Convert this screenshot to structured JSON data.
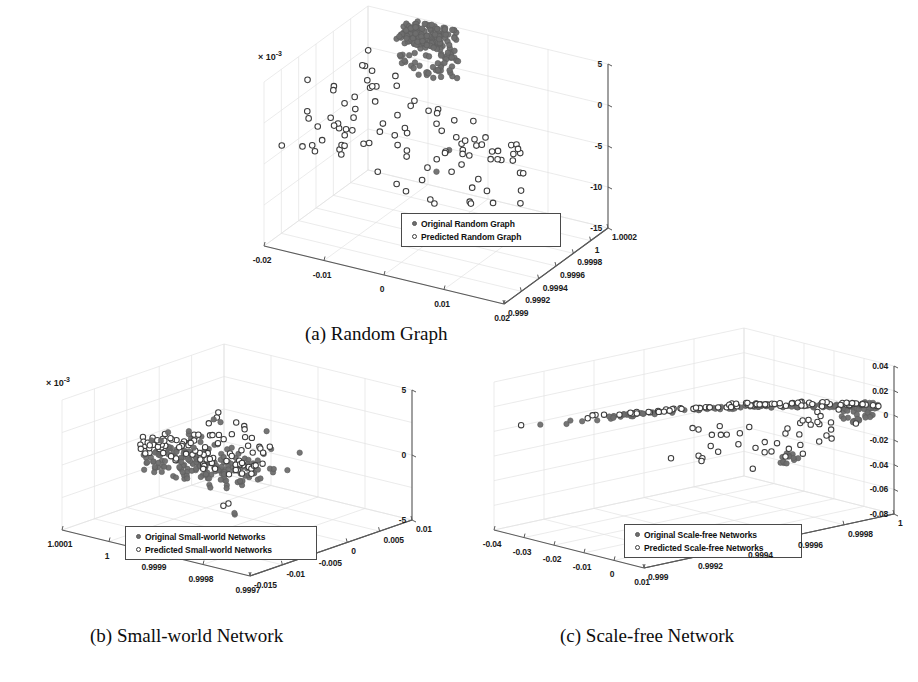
{
  "figure": {
    "background": "#ffffff",
    "marker_filled_color": "#6e6e6e",
    "marker_hollow_color": "#3c3c3c",
    "axis_color": "#5a5a5a",
    "grid_color": "#e2e2e2"
  },
  "panels": [
    {
      "id": "a",
      "caption": "(a) Random Graph",
      "exponent_label": "× 10",
      "exponent_sup": "-3",
      "z_ticks": [
        "5",
        "0",
        "-5",
        "-10",
        "-15"
      ],
      "x_ticks": [
        "-0.02",
        "-0.01",
        "0",
        "0.01",
        "0.02"
      ],
      "y_ticks": [
        "0.999",
        "0.9992",
        "0.9994",
        "0.9996",
        "0.9998",
        "1",
        "1.0002"
      ],
      "legend": {
        "original": "Original Random Graph",
        "predicted": "Predicted Random Graph"
      }
    },
    {
      "id": "b",
      "caption": "(b) Small-world Network",
      "exponent_label": "× 10",
      "exponent_sup": "-3",
      "z_ticks": [
        "5",
        "0",
        "-5"
      ],
      "x_ticks": [
        "1.0001",
        "1",
        "0.9999",
        "0.9998",
        "0.9997"
      ],
      "y_ticks": [
        "-0.015",
        "-0.01",
        "-0.005",
        "0",
        "0.005",
        "0.01"
      ],
      "legend": {
        "original": "Original Small-world Networks",
        "predicted": "Predicted Small-world Networks"
      }
    },
    {
      "id": "c",
      "caption": "(c) Scale-free Network",
      "exponent_label": "",
      "exponent_sup": "",
      "z_ticks": [
        "0.04",
        "0.02",
        "0",
        "-0.02",
        "-0.04",
        "-0.06",
        "-0.08"
      ],
      "x_ticks": [
        "-0.04",
        "-0.03",
        "-0.02",
        "-0.01",
        "0",
        "0.01"
      ],
      "y_ticks": [
        "0.999",
        "0.9992",
        "0.9994",
        "0.9996",
        "0.9998",
        "1"
      ],
      "legend": {
        "original": "Original Scale-free Networks",
        "predicted": "Predicted Scale-free Networks"
      }
    }
  ],
  "chart_data": {
    "type": "scatter",
    "title": "",
    "projection": "3d",
    "panels": [
      {
        "id": "a",
        "title": "(a) Random Graph",
        "xlabel": "",
        "ylabel": "",
        "zlabel": "",
        "xlim": [
          -0.02,
          0.02
        ],
        "ylim": [
          0.999,
          1.0002
        ],
        "zlim": [
          -0.015,
          0.005
        ],
        "z_scale": "x 10^-3",
        "grid": true,
        "legend_position": "lower-center",
        "series": [
          {
            "name": "Original Random Graph",
            "marker": "filled-circle",
            "color": "#6e6e6e",
            "n_points": 190,
            "description": "Dense crescent-shaped cluster concentrated at high y (near 1.0000-1.0002) arcing from z=+0.005 down to z=-0.005"
          },
          {
            "name": "Predicted Random Graph",
            "marker": "open-circle",
            "color": "#3c3c3c",
            "n_points": 95,
            "description": "Sparse scatter spread across full x range with z mostly between -0.010 and +0.005"
          }
        ]
      },
      {
        "id": "b",
        "title": "(b) Small-world Network",
        "xlabel": "",
        "ylabel": "",
        "zlabel": "",
        "xlim": [
          0.9997,
          1.0001
        ],
        "ylim": [
          -0.015,
          0.01
        ],
        "zlim": [
          -0.005,
          0.005
        ],
        "z_scale": "x 10^-3",
        "grid": true,
        "legend_position": "lower-center",
        "series": [
          {
            "name": "Original Small-world Networks",
            "marker": "filled-circle",
            "color": "#6e6e6e",
            "n_points": 160,
            "description": "Dense horizontal band clustered near z=0, spread in left-center of the box"
          },
          {
            "name": "Predicted Small-world Networks",
            "marker": "open-circle",
            "color": "#3c3c3c",
            "n_points": 110,
            "description": "Overlapping band slightly above the filled band, with several outliers extending right and two low outliers near z=-0.0035"
          }
        ]
      },
      {
        "id": "c",
        "title": "(c) Scale-free Network",
        "xlabel": "",
        "ylabel": "",
        "zlabel": "",
        "xlim": [
          -0.04,
          0.01
        ],
        "ylim": [
          0.999,
          1.0
        ],
        "zlim": [
          -0.08,
          0.04
        ],
        "z_scale": "",
        "grid": true,
        "legend_position": "lower-center",
        "series": [
          {
            "name": "Original Scale-free Networks",
            "marker": "filled-circle",
            "color": "#6e6e6e",
            "n_points": 120,
            "description": "Arc rising from left near z=0 to a dense cluster at the right edge, plus a tight vertical cluster near z=-0.035"
          },
          {
            "name": "Predicted Scale-free Networks",
            "marker": "open-circle",
            "color": "#3c3c3c",
            "n_points": 100,
            "description": "Follows the same arc, with a scattered lobe falling to z between -0.01 and -0.04 in the right half"
          }
        ]
      }
    ]
  }
}
